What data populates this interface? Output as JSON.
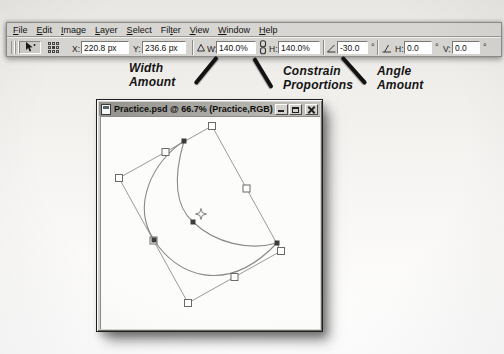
{
  "menu_bar": {
    "items": [
      {
        "pre": "",
        "u": "F",
        "post": "ile"
      },
      {
        "pre": "",
        "u": "E",
        "post": "dit"
      },
      {
        "pre": "",
        "u": "I",
        "post": "mage"
      },
      {
        "pre": "",
        "u": "L",
        "post": "ayer"
      },
      {
        "pre": "",
        "u": "S",
        "post": "elect"
      },
      {
        "pre": "Fil",
        "u": "t",
        "post": "er"
      },
      {
        "pre": "",
        "u": "V",
        "post": "iew"
      },
      {
        "pre": "",
        "u": "W",
        "post": "indow"
      },
      {
        "pre": "",
        "u": "H",
        "post": "elp"
      }
    ]
  },
  "options_bar": {
    "x_label": "X:",
    "x_value": "220.8 px",
    "y_label": "Y:",
    "y_value": "236.6 px",
    "w_label": "W:",
    "w_value": "140.0%",
    "h_label": "H:",
    "h_value": "140.0%",
    "angle_value": "-30.0",
    "degree": "°",
    "skew_h_label": "H:",
    "skew_h_value": "0.0",
    "skew_v_label": "V:",
    "skew_v_value": "0.0",
    "icons": {
      "tool": "move-tool",
      "reference": "reference-point-locator",
      "relative": "relative-positioning-delta",
      "constrain": "constrain-proportions-chain",
      "rotate": "rotate-angle",
      "skew": "skew"
    }
  },
  "callouts": [
    {
      "line1": "Width",
      "line2": "Amount"
    },
    {
      "line1": "Constrain",
      "line2": "Proportions"
    },
    {
      "line1": "Angle",
      "line2": "Amount"
    }
  ],
  "document_window": {
    "title": "Practice.psd @ 66.7% (Practice,RGB)"
  },
  "canvas": {
    "paths": {
      "bbox": "M111,9 L180,134 L87,186 L18,61 Z",
      "outer": "M83,24 C52,44 30,88 53,123 C75,158 125,180 176,126",
      "inner": "M83,24 C73,58 73,88 92,105 C114,126 148,134 176,126"
    },
    "handles": [
      {
        "x": 111,
        "y": 9
      },
      {
        "x": 180,
        "y": 134
      },
      {
        "x": 87,
        "y": 186
      },
      {
        "x": 18,
        "y": 61
      },
      {
        "x": 64.5,
        "y": 35
      },
      {
        "x": 145.5,
        "y": 71.5
      },
      {
        "x": 133.5,
        "y": 160
      },
      {
        "x": 52.5,
        "y": 123.5
      }
    ],
    "anchors": [
      {
        "x": 83,
        "y": 24
      },
      {
        "x": 92,
        "y": 105
      },
      {
        "x": 53,
        "y": 123
      },
      {
        "x": 176,
        "y": 126
      }
    ],
    "center": {
      "x": 100,
      "y": 97
    }
  },
  "colors": {
    "toolbar_gray": "#d6d4d0",
    "titlebar_gray": "#a8a6a1",
    "field_white": "#ffffff",
    "callout_black": "#141414",
    "outline_gray": "#8e8c88"
  }
}
